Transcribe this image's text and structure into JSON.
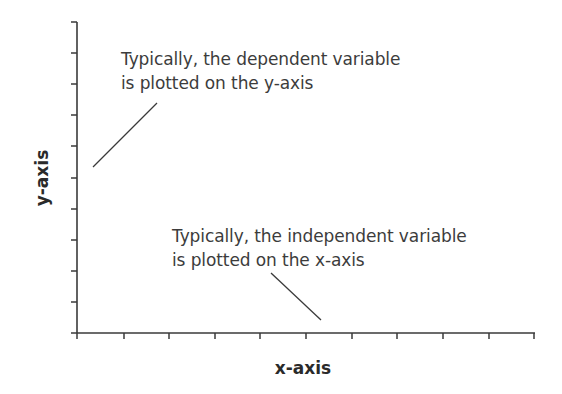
{
  "diagram": {
    "type": "axes-explainer",
    "xlabel": "x-axis",
    "ylabel": "y-axis",
    "annotations": {
      "y": {
        "line1": "Typically, the dependent variable",
        "line2": "is plotted on the y-axis"
      },
      "x": {
        "line1": "Typically, the independent variable",
        "line2": "is plotted on the x-axis"
      }
    },
    "ticks": {
      "x_count": 11,
      "y_count": 11
    },
    "colors": {
      "axis": "#3a3a3a",
      "text": "#3c3c3c",
      "background": "#ffffff"
    }
  }
}
